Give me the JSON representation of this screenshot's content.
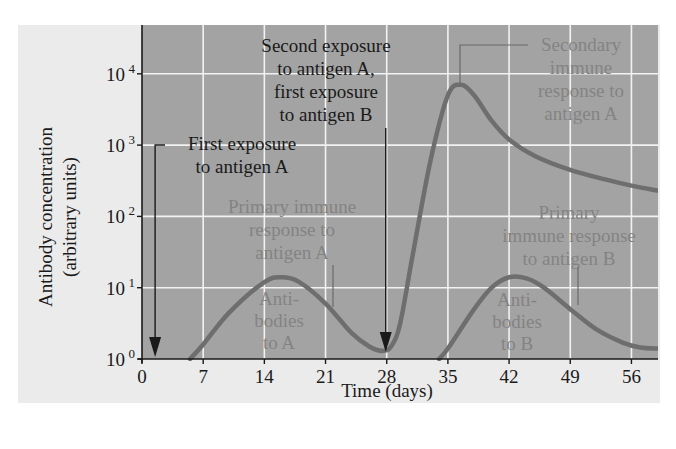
{
  "chart_data": {
    "type": "line",
    "title": "",
    "xlabel": "Time (days)",
    "ylabel": "Antibody concentration",
    "ylabel_sub": "(arbitrary units)",
    "x_ticks": [
      "0",
      "7",
      "14",
      "21",
      "28",
      "35",
      "42",
      "49",
      "56"
    ],
    "x_tick_values": [
      0,
      7,
      14,
      21,
      28,
      35,
      42,
      49,
      56
    ],
    "y_ticks": [
      {
        "base": "10",
        "exp": "0",
        "value": 1
      },
      {
        "base": "10",
        "exp": "1",
        "value": 10
      },
      {
        "base": "10",
        "exp": "2",
        "value": 100
      },
      {
        "base": "10",
        "exp": "3",
        "value": 1000
      },
      {
        "base": "10",
        "exp": "4",
        "value": 10000
      }
    ],
    "xlim": [
      0,
      59
    ],
    "ylim": [
      1,
      50000
    ],
    "yscale": "log",
    "grid": true,
    "series": [
      {
        "name": "Antibodies to A",
        "x": [
          5.5,
          7,
          10,
          14,
          16,
          18,
          21,
          24,
          26,
          27.5,
          28.5,
          29.5,
          31,
          33,
          35,
          36.5,
          38,
          40,
          42,
          45,
          49,
          53,
          56,
          59
        ],
        "y": [
          1,
          1.6,
          4.5,
          12,
          14,
          12,
          6,
          2.3,
          1.5,
          1.3,
          1.5,
          3,
          30,
          600,
          5000,
          7000,
          5000,
          2200,
          1200,
          700,
          450,
          330,
          270,
          230
        ]
      },
      {
        "name": "Antibodies to B",
        "x": [
          34,
          35,
          38,
          40,
          42,
          44,
          46,
          49,
          52,
          55,
          57,
          59
        ],
        "y": [
          1,
          1.4,
          5,
          10,
          14,
          13.5,
          10,
          5,
          2.6,
          1.7,
          1.45,
          1.4
        ]
      }
    ],
    "annotations": [
      {
        "id": "first-exposure-a",
        "lines": [
          "First exposure",
          "to antigen A"
        ],
        "arrow_at_day": 1.5,
        "style": "dark"
      },
      {
        "id": "second-exposure",
        "lines": [
          "Second exposure",
          "to antigen A,",
          "first exposure",
          "to antigen B"
        ],
        "arrow_at_day": 28,
        "style": "dark"
      },
      {
        "id": "secondary-a",
        "lines": [
          "Secondary",
          "immune",
          "response to",
          "antigen A"
        ],
        "points_to_day": 36.5,
        "style": "light"
      },
      {
        "id": "primary-a",
        "lines": [
          "Primary immune",
          "response to",
          "antigen A"
        ],
        "points_to_day": 24.5,
        "style": "light"
      },
      {
        "id": "primary-b",
        "lines": [
          "Primary",
          "immune response",
          "to antigen B"
        ],
        "points_to_day": 50.5,
        "style": "light"
      },
      {
        "id": "antibodies-a",
        "lines": [
          "Anti-",
          "bodies",
          "to A"
        ],
        "style": "light"
      },
      {
        "id": "antibodies-b",
        "lines": [
          "Anti-",
          "bodies",
          "to B"
        ],
        "style": "light"
      }
    ]
  },
  "colors": {
    "plot_bg": "#a3a3a3",
    "outer_bg": "#ebebeb",
    "gridline": "#f2f2f2",
    "curve": "#6e6e6e",
    "dark_text": "#1a1a1a",
    "light_text": "#838383",
    "axis": "#1a1a1a"
  }
}
